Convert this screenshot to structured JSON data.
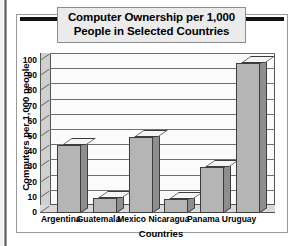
{
  "figure": {
    "title": "Computer Ownership per 1,000 People in Selected Countries",
    "title_line1": "Computer Ownership per 1,000",
    "title_line2": "People in Selected Countries"
  },
  "chart_data": {
    "type": "bar",
    "title": "Computer Ownership per 1,000 People in Selected Countries",
    "xlabel": "Countries",
    "ylabel": "Computers per 1,000 people",
    "categories": [
      "Argentina",
      "Guatemala",
      "Mexico",
      "Nicaragua",
      "Panama",
      "Uruguay"
    ],
    "values": [
      45,
      10,
      50,
      9,
      30,
      99
    ],
    "ylim": [
      0,
      100
    ],
    "yticks": [
      0,
      10,
      20,
      30,
      40,
      50,
      60,
      70,
      80,
      90,
      100
    ],
    "ytick_labels": [
      "0",
      "10",
      "20",
      "30",
      "40",
      "50",
      "60",
      "70",
      "80",
      "90",
      "100"
    ],
    "grid": true,
    "legend": false,
    "style": "3d-bar",
    "colors": {
      "bar_front": "#b5b5b5",
      "bar_side": "#8e8e8e",
      "bar_top": "#f4f4f4",
      "outline": "#3d3d3d",
      "plot_background": "#fbfbfb",
      "gridline": "#6f6f6f",
      "title_plaque": "#ebebeb",
      "rule": "#111111"
    }
  }
}
